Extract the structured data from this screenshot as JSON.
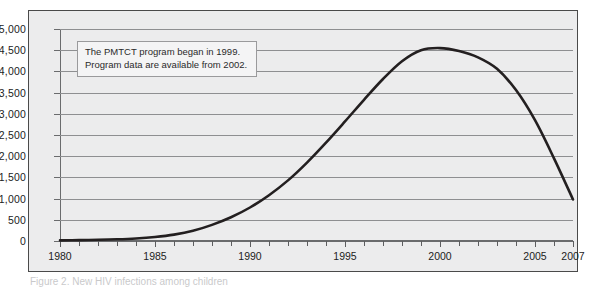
{
  "figure": {
    "caption": "Figure 2. New HIV infections among children",
    "annotation": {
      "line1": "The PMTCT program began in 1999.",
      "line2": "Program data are available from 2002."
    },
    "colors": {
      "border": "#4a4a4a",
      "plot_background": "#ececed",
      "gridline": "#8e8f91",
      "series": "#231f20",
      "annotation_border": "#9a9a9c"
    }
  },
  "chart_data": {
    "type": "line",
    "title": "",
    "subtitle": "",
    "xlabel": "",
    "ylabel": "",
    "xlim": [
      1980,
      2007
    ],
    "ylim": [
      0,
      5000
    ],
    "grid": true,
    "legend": "none",
    "ytick_labels": [
      "0",
      "500",
      "1,000",
      "1,500",
      "2,000",
      "2,500",
      "3,000",
      "3,500",
      "4,000",
      "4,500",
      "5,000"
    ],
    "ytick_values": [
      0,
      500,
      1000,
      1500,
      2000,
      2500,
      3000,
      3500,
      4000,
      4500,
      5000
    ],
    "xtick_labels": [
      "1980",
      "1985",
      "1990",
      "1995",
      "2000",
      "2005",
      "2007"
    ],
    "xtick_values": [
      1980,
      1985,
      1990,
      1995,
      2000,
      2005,
      2007
    ],
    "xtick_minor_values": [
      1981,
      1982,
      1983,
      1984,
      1986,
      1987,
      1988,
      1989,
      1991,
      1992,
      1993,
      1994,
      1996,
      1997,
      1998,
      1999,
      2001,
      2002,
      2003,
      2004,
      2006
    ],
    "series": [
      {
        "name": "New HIV infections among children",
        "x": [
          1980,
          1981,
          1982,
          1983,
          1984,
          1985,
          1986,
          1987,
          1988,
          1989,
          1990,
          1991,
          1992,
          1993,
          1994,
          1995,
          1996,
          1997,
          1998,
          1999,
          2000,
          2001,
          2002,
          2003,
          2004,
          2005,
          2006,
          2007
        ],
        "values": [
          15,
          20,
          28,
          40,
          60,
          95,
          150,
          240,
          380,
          560,
          790,
          1080,
          1430,
          1850,
          2320,
          2820,
          3330,
          3820,
          4240,
          4500,
          4550,
          4480,
          4330,
          4060,
          3560,
          2850,
          1950,
          980
        ]
      }
    ],
    "annotations": [
      {
        "text": "The PMTCT program began in 1999. Program data are available from 2002.",
        "position": "upper-left"
      }
    ]
  }
}
